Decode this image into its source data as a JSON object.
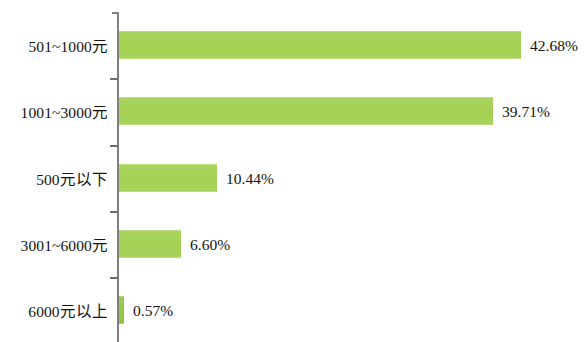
{
  "chart_data": {
    "type": "bar",
    "orientation": "horizontal",
    "title": "",
    "subtitle": "",
    "xlabel": "",
    "ylabel": "",
    "categories": [
      "501~1000元",
      "1001~3000元",
      "500元以下",
      "3001~6000元",
      "6000元以上"
    ],
    "values": [
      42.68,
      39.71,
      10.44,
      6.6,
      0.57
    ],
    "value_labels": [
      "42.68%",
      "39.71%",
      "10.44%",
      "6.60%",
      "0.57%"
    ],
    "unit": "%",
    "xlim": [
      0,
      45
    ],
    "grid": false,
    "legend": null,
    "legend_position": "none",
    "series": [
      {
        "name": "",
        "values": [
          42.68,
          39.71,
          10.44,
          6.6,
          0.57
        ]
      }
    ],
    "colors": {
      "bar": "#a6d257",
      "bar_small": "#8cc63f",
      "axis": "#807f7d",
      "tick": "#6f6e6c",
      "label_text": "#141414",
      "value_text": "#121212",
      "background": "#ffffff"
    }
  },
  "axis": {
    "tick_count": 4
  }
}
